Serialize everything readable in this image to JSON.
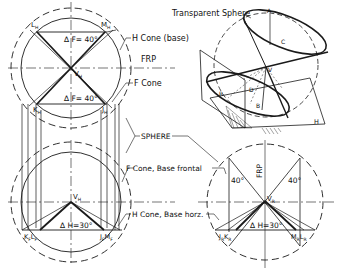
{
  "diagram": {
    "kind": "descriptive-geometry-construction",
    "colors": {
      "ink": "#1a1a1a",
      "background": "#ffffff"
    },
    "top_view": {
      "labels": {
        "L": "L",
        "L_sub": "H",
        "M": "M",
        "M_sub": "H",
        "K": "K",
        "K_sub": "H",
        "J": "J",
        "J_sub": "H",
        "V": "V",
        "V_sub": "H",
        "angle_top": "∆ F= 40°",
        "angle_bottom": "∆ F= 40°"
      }
    },
    "front_view": {
      "labels": {
        "V": "V",
        "V_sub": "H",
        "KL": "K",
        "KL_sub1": "F",
        "L2": "L",
        "L2_sub": "F",
        "JM": "J",
        "JM_sub1": "F",
        "M2": "M",
        "M2_sub": "F",
        "angle": "∆ H=30°"
      }
    },
    "side_view": {
      "labels": {
        "V": "V",
        "V_sub": "R",
        "J": "J",
        "J_sub": "R",
        "K": "K",
        "K_sub": "R",
        "M": "M",
        "M_sub": "R",
        "L": "L",
        "L_sub": "R",
        "angle_left": "40°",
        "angle_right": "40°",
        "angle_bottom": "∆ H=30°",
        "frp_vertical": "FRP"
      }
    },
    "pictorial": {
      "title": "Transparent Sphere",
      "points": [
        "A",
        "C",
        "V",
        "D",
        "B",
        "R",
        "H"
      ]
    },
    "callouts": {
      "h_cone_base": "H Cone (base)",
      "frp": "FRP",
      "f_cone": "F Cone",
      "sphere": "SPHERE",
      "f_cone_base_frontal": "F Cone, Base frontal",
      "h_cone_base_horz": "H Cone, Base horz."
    }
  }
}
